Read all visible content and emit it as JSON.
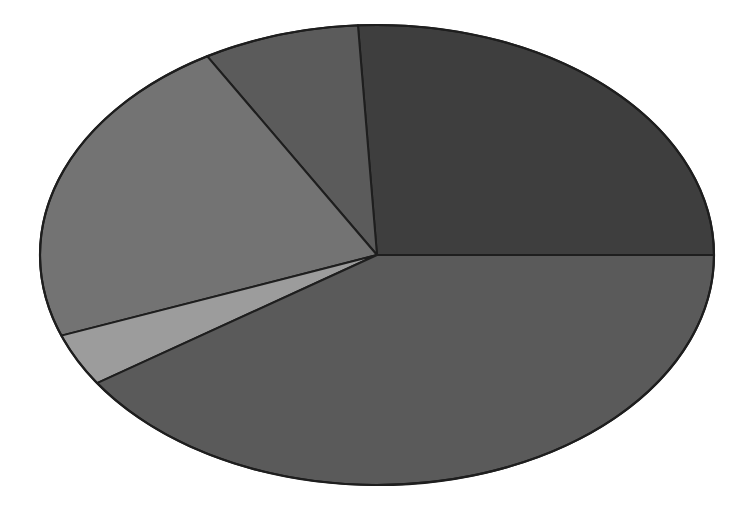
{
  "chart_data": {
    "type": "pie",
    "title": "",
    "categories": [
      "Slice A",
      "Slice B",
      "Slice C",
      "Slice D",
      "Slice E"
    ],
    "values": [
      25.9,
      7.5,
      22.3,
      3.7,
      40.6
    ],
    "colors": [
      "#3e3e3e",
      "#5b5b5b",
      "#737373",
      "#9c9c9c",
      "#5a5a5a"
    ],
    "start_angle_deg": 0,
    "direction": "counterclockwise",
    "legend": "none",
    "labels_shown": false,
    "geometry": {
      "cx": 377,
      "cy": 255,
      "rx": 337,
      "ry": 230
    }
  }
}
